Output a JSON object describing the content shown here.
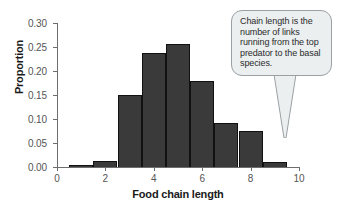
{
  "chart_data": {
    "type": "bar",
    "title": "",
    "subtitle": "",
    "xlabel": "Food chain length",
    "ylabel": "Proportion",
    "xlim": [
      0,
      10
    ],
    "ylim": [
      0.0,
      0.3
    ],
    "grid": false,
    "legend": "none",
    "bin_width": 1,
    "bin_starts": [
      0.5,
      1.5,
      2.5,
      3.5,
      4.5,
      5.5,
      6.5,
      7.5,
      8.5
    ],
    "bin_centers": [
      1,
      2,
      3,
      4,
      5,
      6,
      7,
      8,
      9
    ],
    "categories": [
      "1",
      "2",
      "3",
      "4",
      "5",
      "6",
      "7",
      "8",
      "9"
    ],
    "values": [
      0.005,
      0.012,
      0.151,
      0.238,
      0.257,
      0.18,
      0.091,
      0.076,
      0.011
    ],
    "x_ticks": [
      {
        "value": 0,
        "label": "0"
      },
      {
        "value": 2,
        "label": "2"
      },
      {
        "value": 4,
        "label": "4"
      },
      {
        "value": 6,
        "label": "6"
      },
      {
        "value": 8,
        "label": "8"
      },
      {
        "value": 10,
        "label": "10"
      }
    ],
    "y_ticks": [
      {
        "value": 0.0,
        "label": "0.00"
      },
      {
        "value": 0.05,
        "label": "0.05"
      },
      {
        "value": 0.1,
        "label": "0.10"
      },
      {
        "value": 0.15,
        "label": "0.15"
      },
      {
        "value": 0.2,
        "label": "0.20"
      },
      {
        "value": 0.25,
        "label": "0.25"
      },
      {
        "value": 0.3,
        "label": "0.30"
      }
    ],
    "annotations": [
      {
        "text": "Chain length is the number of links running from the top predator to the basal species.",
        "points_to_x": 10,
        "points_to_y": 0.0
      }
    ],
    "colors": {
      "bar_fill": "#3a3a3a",
      "bar_edge": "#111111",
      "axis": "#6d6d6d",
      "tick_label": "#555555",
      "axis_title": "#1a1a1a",
      "callout_fill": "#eceff0",
      "callout_border": "#9aa0a3",
      "callout_text": "#2b2b2b",
      "background": "#ffffff"
    }
  },
  "callout": {
    "text": "Chain length is the number of links running from the top predator to the basal species."
  },
  "axes": {
    "x_title": "Food chain length",
    "y_title": "Proportion"
  }
}
